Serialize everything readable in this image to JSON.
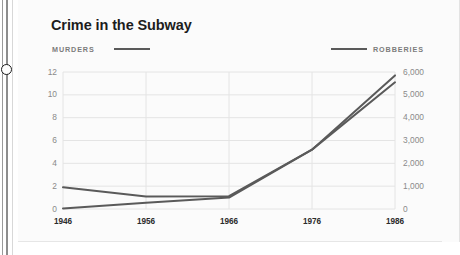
{
  "scrubber": {
    "handle_name": "scrub-handle"
  },
  "card": {
    "title": "Crime in the Subway"
  },
  "legend": {
    "left": {
      "label": "MURDERS",
      "color": "#5a5a5a"
    },
    "right": {
      "label": "ROBBERIES",
      "color": "#5a5a5a"
    }
  },
  "chart_data": {
    "type": "line",
    "title": "Crime in the Subway",
    "xlabel": "",
    "ylabel": "",
    "grid": true,
    "legend_position": "top",
    "x": [
      1946,
      1956,
      1966,
      1976,
      1986
    ],
    "xtick_labels": [
      "1946",
      "1956",
      "1966",
      "1976",
      "1986"
    ],
    "axes": [
      {
        "id": "left",
        "name": "MURDERS",
        "ylim": [
          0,
          12
        ],
        "ytick_values": [
          0,
          2,
          4,
          6,
          8,
          10,
          12
        ],
        "ytick_labels": [
          "0",
          "2",
          "4",
          "6",
          "8",
          "10",
          "12"
        ]
      },
      {
        "id": "right",
        "name": "ROBBERIES",
        "ylim": [
          0,
          6000
        ],
        "ytick_values": [
          0,
          1000,
          2000,
          3000,
          4000,
          5000,
          6000
        ],
        "ytick_labels": [
          "0",
          "1,000",
          "2,000",
          "3,000",
          "4,000",
          "5,000",
          "6,000"
        ]
      }
    ],
    "series": [
      {
        "name": "MURDERS",
        "axis": "left",
        "color": "#5a5a5a",
        "values": [
          0.05,
          0.55,
          1.0,
          5.2,
          11.1
        ]
      },
      {
        "name": "ROBBERIES",
        "axis": "right",
        "color": "#5a5a5a",
        "values": [
          950,
          550,
          560,
          2600,
          5850
        ]
      }
    ]
  }
}
